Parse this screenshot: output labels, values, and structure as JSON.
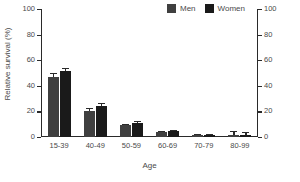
{
  "chart_data": {
    "type": "bar",
    "title": "",
    "xlabel": "Age",
    "ylabel": "Relative survival (%)",
    "categories": [
      "15-39",
      "40-49",
      "50-59",
      "60-69",
      "70-79",
      "80-99"
    ],
    "series": [
      {
        "name": "Men",
        "color": "#3f3f3f",
        "values": [
          47,
          20.5,
          9,
          4,
          1.5,
          1.5
        ],
        "errors": [
          3,
          2,
          1.5,
          1,
          1,
          3.5
        ]
      },
      {
        "name": "Women",
        "color": "#1a1a1a",
        "values": [
          51.5,
          24,
          11,
          4.5,
          1.5,
          1.5
        ],
        "errors": [
          2.5,
          2.5,
          1.5,
          1,
          1,
          2.5
        ]
      }
    ],
    "ylim": [
      0,
      100
    ],
    "yticks": [
      0,
      20,
      40,
      60,
      80,
      100
    ],
    "ytick_labels": [
      "0",
      "20",
      "40",
      "60",
      "80",
      "100"
    ],
    "right_axis": {
      "ylim": [
        0,
        100
      ],
      "yticks": [
        0,
        20,
        40,
        60,
        80,
        100
      ],
      "ytick_labels": [
        "0",
        "20",
        "40",
        "60",
        "80",
        "100"
      ]
    },
    "grid": false,
    "legend_position": "top-right",
    "error_bars": "symmetric"
  },
  "legend": {
    "items": [
      {
        "label": "Men",
        "color": "#3f3f3f",
        "swatch_name": "legend-swatch-men"
      },
      {
        "label": "Women",
        "color": "#1a1a1a",
        "swatch_name": "legend-swatch-women"
      }
    ]
  },
  "axes": {
    "y_title": "Relative survival (%)",
    "x_title": "Age"
  }
}
